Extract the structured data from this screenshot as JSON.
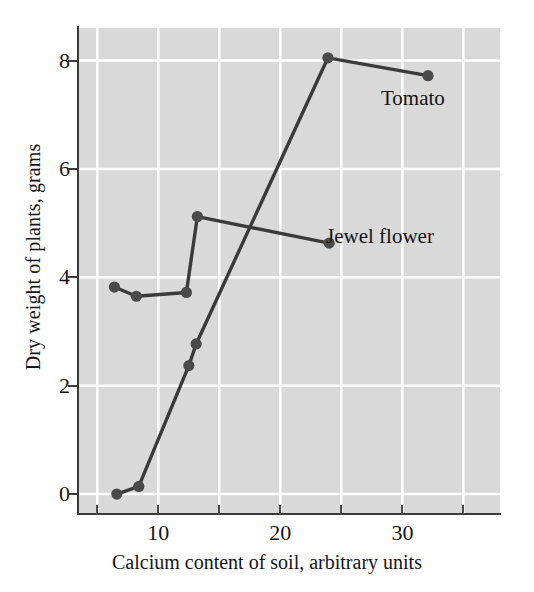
{
  "chart_data": {
    "type": "line",
    "title": "",
    "xlabel": "Calcium content of soil, arbitrary units",
    "ylabel": "Dry weight of plants, grams",
    "xlim": [
      3.5,
      38
    ],
    "ylim": [
      -0.35,
      8.6
    ],
    "xticks": [
      10,
      20,
      30
    ],
    "xtick_labels": [
      "10",
      "20",
      "30"
    ],
    "xticks_minor": [
      5,
      15,
      25,
      35
    ],
    "yticks": [
      0,
      2,
      4,
      6,
      8
    ],
    "ytick_labels": [
      "0",
      "2",
      "4",
      "6",
      "8"
    ],
    "grid": true,
    "grid_color": "#ffffff",
    "plot_background": "#d9d9d9",
    "figure_background": "#ffffff",
    "line_color": "#3a3a3a",
    "marker_color": "#4a4a4a",
    "legend_position": "inline-annotation",
    "series": [
      {
        "name": "Jewel flower",
        "label": "Jewel flower",
        "annotation": "Jewel flower",
        "x": [
          6.4,
          8.2,
          12.3,
          13.2,
          24.0
        ],
        "y": [
          3.82,
          3.65,
          3.72,
          5.12,
          4.63
        ]
      },
      {
        "name": "Tomato",
        "label": "Tomato",
        "annotation": "Tomato",
        "x": [
          6.6,
          8.4,
          12.5,
          13.1,
          23.9,
          32.1
        ],
        "y": [
          0.0,
          0.14,
          2.37,
          2.77,
          8.05,
          7.72
        ]
      }
    ]
  },
  "annotations": {
    "tomato": "Tomato",
    "jewel_flower": "Jewel flower"
  }
}
